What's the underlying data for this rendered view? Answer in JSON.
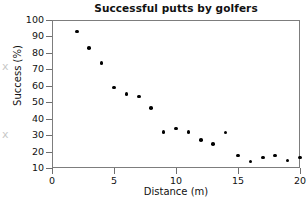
{
  "chart_data": {
    "type": "scatter",
    "title": "Successful putts by golfers",
    "xlabel": "Distance (m)",
    "ylabel": "Success (%)",
    "xlim": [
      0,
      20
    ],
    "ylim": [
      10,
      100
    ],
    "xticks": [
      0,
      5,
      10,
      15,
      20
    ],
    "yticks": [
      10,
      20,
      30,
      40,
      50,
      60,
      70,
      80,
      90,
      100
    ],
    "grid": false,
    "legend": null,
    "series": [
      {
        "name": "Successful putts",
        "marker": "filled-circle",
        "color": "#000000",
        "x": [
          2,
          3,
          4,
          5,
          6,
          7,
          8,
          9,
          10,
          11,
          12,
          13,
          14,
          15,
          16,
          17,
          18,
          19,
          20
        ],
        "y": [
          93,
          83,
          74,
          59,
          55,
          53.5,
          46.5,
          32,
          34,
          32,
          27,
          24.5,
          31.5,
          17.5,
          14,
          16.5,
          17.5,
          14.5,
          16.5
        ]
      }
    ]
  },
  "axes": {
    "x": {
      "label": "Distance (m)",
      "tick_labels": [
        "0",
        "5",
        "10",
        "15",
        "20"
      ]
    },
    "y": {
      "label": "Success (%)",
      "tick_labels": [
        "10",
        "20",
        "30",
        "40",
        "50",
        "60",
        "70",
        "80",
        "90",
        "100"
      ]
    }
  },
  "scan_marks": [
    "x",
    "x"
  ],
  "colors": {
    "marker": "#000000",
    "frame": "#7d7d7d",
    "text": "#111111",
    "background": "#ffffff"
  }
}
